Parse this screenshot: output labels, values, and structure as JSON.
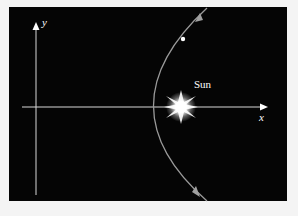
{
  "diagram": {
    "title": "",
    "labels": {
      "y_axis": "y",
      "x_axis": "x",
      "sun": "Sun"
    },
    "elements": [
      {
        "type": "axis",
        "name": "x-axis",
        "direction": "horizontal"
      },
      {
        "type": "axis",
        "name": "y-axis",
        "direction": "vertical"
      },
      {
        "type": "star",
        "name": "sun",
        "label": "Sun"
      },
      {
        "type": "curve",
        "name": "parabolic-orbit",
        "shape": "parabola opening right"
      },
      {
        "type": "point",
        "name": "comet"
      }
    ],
    "colors": {
      "background": "#050505",
      "frame": "#f4f4f4",
      "axes": "#d8d8d8",
      "orbit": "#9a9a9a",
      "sun": "#ffffff"
    }
  }
}
